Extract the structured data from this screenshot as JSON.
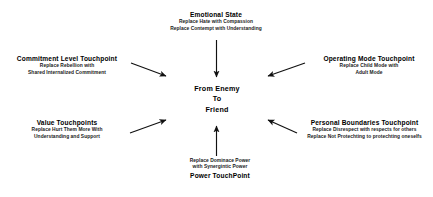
{
  "diagram": {
    "title_text": "From Enemy To Friend Touchpoints",
    "background_color": "#ffffff",
    "text_color": "#000000",
    "center": {
      "line1": "From Enemy",
      "line2": "To",
      "line3": "Friend"
    },
    "nodes": [
      {
        "id": "emotional-state",
        "position": "top",
        "title": "Emotional State",
        "lines": [
          "Replace Hate with Compassion",
          "Replace Contempt with Understanding"
        ],
        "title_position": "above"
      },
      {
        "id": "commitment-level-touchpoint",
        "position": "top-left",
        "title": "Commitment Level Touchpoint",
        "lines": [
          "Replace Rebellion with",
          "Shared Internalized Commitment"
        ],
        "title_position": "above"
      },
      {
        "id": "value-touchpoints",
        "position": "bottom-left",
        "title": "Value Touchpoints",
        "lines": [
          "Replace Hurt Them More With",
          "Understanding and Support"
        ],
        "title_position": "above"
      },
      {
        "id": "operating-mode-touchpoint",
        "position": "top-right",
        "title": "Operating Mode Touchpoint",
        "lines": [
          "Replace Child Mode with",
          "Adult Mode"
        ],
        "title_position": "above"
      },
      {
        "id": "personal-boundaries-touchpoint",
        "position": "bottom-right",
        "title": "Personal Boundaries Touchpoint",
        "lines": [
          "Replace Disrespect with respects for others",
          "Replace Not Protechting to protechting oneselfs"
        ],
        "title_position": "above"
      },
      {
        "id": "power-touchpoint",
        "position": "bottom",
        "title": "Power TouchPoint",
        "lines": [
          "Replace Dominace Power",
          "with Synergintic Power"
        ],
        "title_position": "below"
      }
    ],
    "arrows": [
      {
        "id": "arrow-from-emotional-state",
        "from": "emotional-state",
        "to": "center",
        "direction": "down"
      },
      {
        "id": "arrow-from-commitment-level",
        "from": "commitment-level-touchpoint",
        "to": "center",
        "direction": "right-down"
      },
      {
        "id": "arrow-from-value-touchpoints",
        "from": "value-touchpoints",
        "to": "center",
        "direction": "right-up"
      },
      {
        "id": "arrow-from-operating-mode",
        "from": "operating-mode-touchpoint",
        "to": "center",
        "direction": "left-down"
      },
      {
        "id": "arrow-from-personal-boundaries",
        "from": "personal-boundaries-touchpoint",
        "to": "center",
        "direction": "left-up"
      },
      {
        "id": "arrow-from-power-touchpoint",
        "from": "power-touchpoint",
        "to": "center",
        "direction": "up"
      }
    ]
  }
}
